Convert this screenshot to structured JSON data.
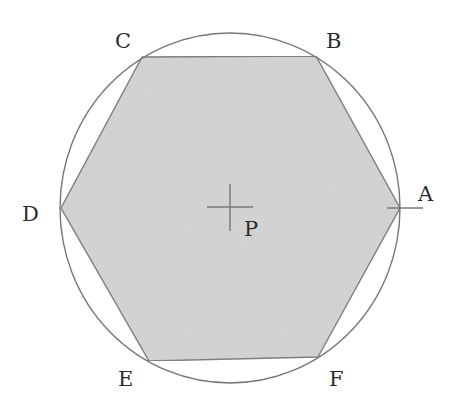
{
  "diagram": {
    "colors": {
      "hexagon_fill": "#d4d4d4",
      "stroke": "#777777",
      "label": "#2a2a2a",
      "background": "#ffffff"
    },
    "center_label": "P",
    "vertices": [
      {
        "id": "A",
        "label": "A"
      },
      {
        "id": "B",
        "label": "B"
      },
      {
        "id": "C",
        "label": "C"
      },
      {
        "id": "D",
        "label": "D"
      },
      {
        "id": "E",
        "label": "E"
      },
      {
        "id": "F",
        "label": "F"
      }
    ]
  }
}
